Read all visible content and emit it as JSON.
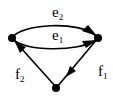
{
  "diagram": {
    "type": "directed-multigraph",
    "colors": {
      "stroke": "#000000",
      "background": "#ffffff"
    },
    "nodes": [
      {
        "id": "left",
        "x": 12,
        "y": 38
      },
      {
        "id": "right",
        "x": 98,
        "y": 38
      },
      {
        "id": "bottom",
        "x": 56,
        "y": 87
      }
    ],
    "edges": [
      {
        "id": "e2",
        "from": "left",
        "to": "right",
        "label": "e",
        "subscript": "2"
      },
      {
        "id": "e1",
        "from": "left",
        "to": "right",
        "label": "e",
        "subscript": "1"
      },
      {
        "id": "f1",
        "from": "right",
        "to": "bottom",
        "label": "f",
        "subscript": "1"
      },
      {
        "id": "f2",
        "from": "bottom",
        "to": "left",
        "label": "f",
        "subscript": "2"
      }
    ]
  }
}
